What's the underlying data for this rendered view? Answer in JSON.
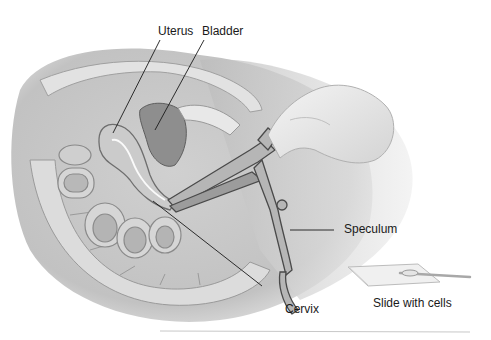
{
  "labels": {
    "uterus": "Uterus",
    "bladder": "Bladder",
    "speculum": "Speculum",
    "cervix": "Cervix",
    "slide": "Slide with cells"
  },
  "colors": {
    "background": "#ffffff",
    "tissue_light": "#e4e4e4",
    "tissue_mid": "#c8c8c8",
    "tissue_dark": "#8a8a8a",
    "leader_line": "#1a1a1a",
    "text": "#1a1a1a"
  }
}
